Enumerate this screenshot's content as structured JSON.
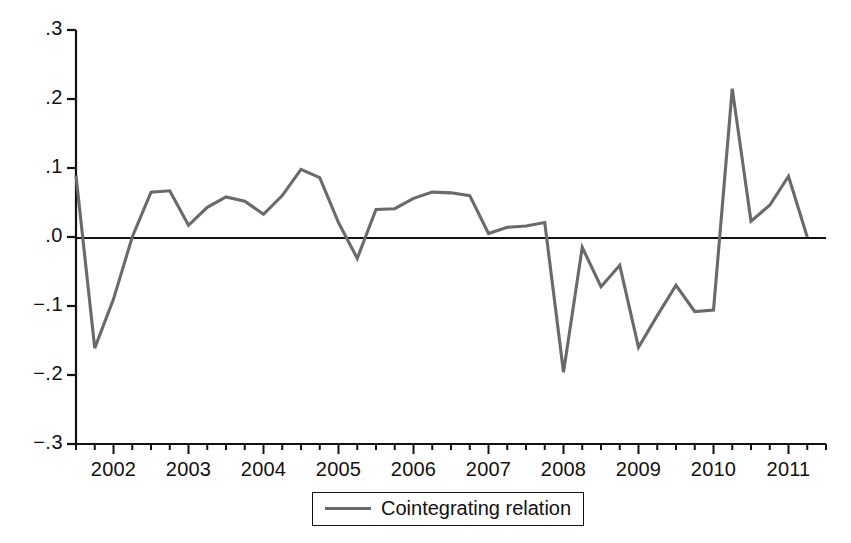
{
  "chart_data": {
    "type": "line",
    "title": "",
    "xlabel": "",
    "ylabel": "",
    "xlim": [
      2001.5,
      2011.5
    ],
    "ylim": [
      -0.3,
      0.3
    ],
    "grid": false,
    "legend_position": "bottom-center",
    "y_ticks": [
      ".3",
      ".2",
      ".1",
      ".0",
      "−.1",
      "−.2",
      "−.3"
    ],
    "y_tick_values": [
      0.3,
      0.2,
      0.1,
      0.0,
      -0.1,
      -0.2,
      -0.3
    ],
    "x_ticks": [
      "2002",
      "2003",
      "2004",
      "2005",
      "2006",
      "2007",
      "2008",
      "2009",
      "2010",
      "2011"
    ],
    "x_tick_values": [
      2002,
      2003,
      2004,
      2005,
      2006,
      2007,
      2008,
      2009,
      2010,
      2011
    ],
    "x_minor_ticks_per_year": 4,
    "zero_line": 0.0,
    "series": [
      {
        "name": "Cointegrating relation",
        "color": "#6a6a6a",
        "x": [
          2001.5,
          2001.75,
          2002.0,
          2002.25,
          2002.5,
          2002.75,
          2003.0,
          2003.25,
          2003.5,
          2003.75,
          2004.0,
          2004.25,
          2004.5,
          2004.75,
          2005.0,
          2005.25,
          2005.5,
          2005.75,
          2006.0,
          2006.25,
          2006.5,
          2006.75,
          2007.0,
          2007.25,
          2007.5,
          2007.75,
          2008.0,
          2008.25,
          2008.5,
          2008.75,
          2009.0,
          2009.25,
          2009.5,
          2009.75,
          2010.0,
          2010.25,
          2010.5,
          2010.75,
          2011.0,
          2011.25
        ],
        "y": [
          0.089,
          -0.161,
          -0.09,
          0.0,
          0.065,
          0.067,
          0.017,
          0.043,
          0.058,
          0.052,
          0.033,
          0.06,
          0.098,
          0.086,
          0.021,
          -0.031,
          0.04,
          0.041,
          0.056,
          0.065,
          0.064,
          0.06,
          0.005,
          0.014,
          0.016,
          0.021,
          -0.196,
          -0.015,
          -0.072,
          -0.041,
          -0.16,
          -0.114,
          -0.07,
          -0.108,
          -0.106,
          0.215,
          0.023,
          0.046,
          0.088,
          0.0
        ]
      }
    ],
    "legend": [
      "Cointegrating relation"
    ]
  },
  "legend": {
    "label": "Cointegrating relation",
    "swatch_color": "#6a6a6a"
  },
  "axes": {
    "line_color": "#111111",
    "zero_line_color": "#111111"
  }
}
